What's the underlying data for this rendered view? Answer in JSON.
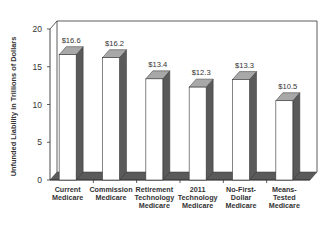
{
  "chart_data": {
    "type": "bar",
    "style": "3d",
    "title": "",
    "xlabel": "",
    "ylabel": "Unfunded Liability in Trillions of Dollars",
    "ylim": [
      0,
      20
    ],
    "yticks": [
      "0",
      "5",
      "10",
      "15",
      "20"
    ],
    "grid": false,
    "legend": null,
    "categories": [
      "Current\nMedicare",
      "Commission\nMedicare",
      "Retirement\nTechnology\nMedicare",
      "2011\nTechnology\nMedicare",
      "No-First-\nDollar\nMedicare",
      "Means-\nTested\nMedicare"
    ],
    "values": [
      16.6,
      16.2,
      13.4,
      12.3,
      13.3,
      10.5
    ],
    "value_labels": [
      "$16.6",
      "$16.2",
      "$13.4",
      "$12.3",
      "$13.3",
      "$10.5"
    ]
  },
  "colors": {
    "bar_front": "#ffffff",
    "bar_top": "#a8a8a8",
    "bar_side": "#5a5a5a",
    "floor": "#5a5a5a",
    "axis": "#333333"
  }
}
